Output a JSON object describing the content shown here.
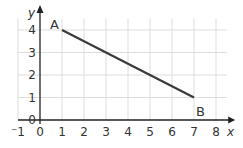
{
  "chart_data": {
    "type": "line",
    "title": "",
    "xlabel": "x",
    "ylabel": "y",
    "xlim": [
      -1,
      8
    ],
    "ylim": [
      0,
      4
    ],
    "grid": true,
    "x_ticks": [
      "-1",
      "0",
      "1",
      "2",
      "3",
      "4",
      "5",
      "6",
      "7",
      "8"
    ],
    "y_ticks": [
      "0",
      "1",
      "2",
      "3",
      "4"
    ],
    "series": [
      {
        "name": "AB",
        "points": [
          {
            "label": "A",
            "x": 1,
            "y": 4
          },
          {
            "label": "B",
            "x": 7,
            "y": 1
          }
        ]
      }
    ],
    "colors": {
      "line": "#3a3a3a",
      "axis": "#222222",
      "grid": "#dddddd"
    }
  }
}
